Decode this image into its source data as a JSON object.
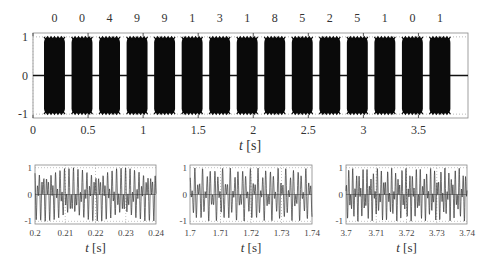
{
  "chart_data": [
    {
      "type": "line",
      "title": "",
      "annotations_top": [
        "0",
        "0",
        "4",
        "9",
        "9",
        "1",
        "3",
        "1",
        "8",
        "5",
        "2",
        "5",
        "1",
        "0",
        "1"
      ],
      "xlabel": "t [s]",
      "ylabel": "",
      "xlim": [
        0,
        3.95
      ],
      "ylim": [
        -1.1,
        1.1
      ],
      "xticks": [
        "0",
        "0.5",
        "1",
        "1.5",
        "2",
        "2.5",
        "3",
        "3.5"
      ],
      "yticks": [
        "-1",
        "0",
        "1"
      ],
      "bursts": {
        "count": 15,
        "start_s": 0.1,
        "duration_s": 0.19,
        "period_s": 0.25,
        "amplitude": 1
      },
      "grid": "dotted"
    },
    {
      "type": "line",
      "xlabel": "t [s]",
      "xlim": [
        0.2,
        0.24
      ],
      "ylim": [
        -1.1,
        1.1
      ],
      "xticks": [
        "0.2",
        "0.21",
        "0.22",
        "0.23",
        "0.24"
      ],
      "yticks": [
        "-1",
        "0",
        "1"
      ],
      "grid": "dotted"
    },
    {
      "type": "line",
      "xlabel": "t [s]",
      "xlim": [
        1.7,
        1.74
      ],
      "ylim": [
        -1.1,
        1.1
      ],
      "xticks": [
        "1.7",
        "1.71",
        "1.72",
        "1.73",
        "1.74"
      ],
      "yticks": [
        "-1",
        "0",
        "1"
      ],
      "grid": "dotted"
    },
    {
      "type": "line",
      "xlabel": "t [s]",
      "xlim": [
        3.7,
        3.74
      ],
      "ylim": [
        -1.1,
        1.1
      ],
      "xticks": [
        "3.7",
        "3.71",
        "3.72",
        "3.73",
        "3.74"
      ],
      "yticks": [
        "-1",
        "0",
        "1"
      ],
      "grid": "dotted"
    }
  ],
  "labels": {
    "t": "t",
    "unit": "[s]"
  }
}
